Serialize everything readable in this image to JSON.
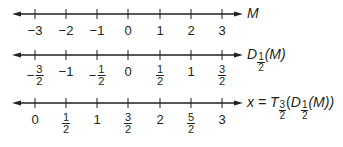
{
  "tick_x": [
    35,
    66,
    97,
    128,
    160,
    191,
    222
  ],
  "lines": [
    {
      "id": "M",
      "y": 14,
      "label_y": 28,
      "ticks": [
        {
          "neg": true,
          "whole": "3"
        },
        {
          "neg": true,
          "whole": "2"
        },
        {
          "neg": true,
          "whole": "1"
        },
        {
          "neg": false,
          "whole": "0"
        },
        {
          "neg": false,
          "whole": "1"
        },
        {
          "neg": false,
          "whole": "2"
        },
        {
          "neg": false,
          "whole": "3"
        }
      ],
      "name": {
        "main": "M"
      }
    },
    {
      "id": "D",
      "y": 55,
      "ticks": [
        {
          "neg": true,
          "num": "3",
          "den": "2"
        },
        {
          "neg": true,
          "whole": "1"
        },
        {
          "neg": true,
          "num": "1",
          "den": "2"
        },
        {
          "neg": false,
          "whole": "0"
        },
        {
          "neg": false,
          "num": "1",
          "den": "2"
        },
        {
          "neg": false,
          "whole": "1"
        },
        {
          "neg": false,
          "num": "3",
          "den": "2"
        }
      ],
      "name": {
        "func": "D",
        "func_sub_num": "1",
        "func_sub_den": "2",
        "arg": "(M)"
      }
    },
    {
      "id": "x",
      "y": 103,
      "ticks": [
        {
          "neg": false,
          "whole": "0"
        },
        {
          "neg": false,
          "num": "1",
          "den": "2"
        },
        {
          "neg": false,
          "whole": "1"
        },
        {
          "neg": false,
          "num": "3",
          "den": "2"
        },
        {
          "neg": false,
          "whole": "2"
        },
        {
          "neg": false,
          "num": "5",
          "den": "2"
        },
        {
          "neg": false,
          "whole": "3"
        }
      ],
      "name": {
        "prefix": "x = ",
        "func": "T",
        "func_sub_num": "3",
        "func_sub_den": "2",
        "inner_func": "D",
        "inner_sub_num": "1",
        "inner_sub_den": "2",
        "arg": "(M))"
      }
    }
  ],
  "colors": {
    "ink": "#231f20",
    "background": "#ffffff"
  }
}
